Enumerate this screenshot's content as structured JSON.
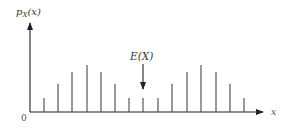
{
  "chart_data": {
    "type": "stem",
    "title": "",
    "ylabel": "p_X(x)",
    "ylabel_var": "p",
    "ylabel_sub": "X",
    "ylabel_arg": "(x)",
    "xlabel": "x",
    "origin_label": "0",
    "annotation": {
      "text": "E(X)",
      "points_to_index": 7
    },
    "axes": {
      "x_arrow": true,
      "y_arrow": true,
      "grid": false,
      "ticks": false
    },
    "stems": {
      "x_px": [
        44,
        58,
        72,
        87,
        101,
        115,
        129,
        143,
        158,
        172,
        187,
        201,
        216,
        230,
        244
      ],
      "relative_heights": [
        0.3,
        0.6,
        0.85,
        1.0,
        0.85,
        0.6,
        0.3,
        0.3,
        0.3,
        0.6,
        0.85,
        1.0,
        0.85,
        0.6,
        0.3
      ]
    }
  },
  "colors": {
    "axis": "#222222",
    "stem": "#555555",
    "text": "#333333"
  }
}
